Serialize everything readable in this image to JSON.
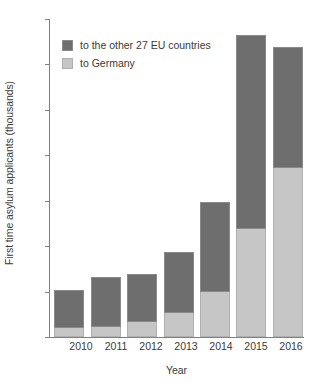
{
  "chart_data": {
    "type": "bar",
    "stacked": true,
    "title": "",
    "xlabel": "Year",
    "ylabel": "First time asylum applicants (thousands)",
    "categories": [
      "2010",
      "2011",
      "2012",
      "2013",
      "2014",
      "2015",
      "2016"
    ],
    "series": [
      {
        "name": "to Germany",
        "color": "#c6c6c6",
        "values": [
          41,
          45,
          64,
          105,
          200,
          476,
          745
        ]
      },
      {
        "name": "to the other 27 EU countries",
        "color": "#6e6e6e",
        "values": [
          165,
          220,
          215,
          270,
          395,
          855,
          530
        ]
      }
    ],
    "totals": [
      206,
      265,
      279,
      375,
      595,
      1331,
      1275
    ],
    "ylim": [
      0,
      1400
    ],
    "yticks": [
      0,
      200,
      400,
      600,
      800,
      1000,
      1200,
      1400
    ],
    "ytick_labels": [
      "0",
      "200",
      "400",
      "600",
      "800",
      "1000",
      "1200",
      "1400"
    ],
    "grid": false,
    "legend_position": "upper left",
    "legend": [
      "to the other 27 EU countries",
      "to Germany"
    ]
  },
  "colors": {
    "eu_other": "#6e6e6e",
    "germany": "#c6c6c6",
    "axis": "#808080",
    "text": "#3a3a3a",
    "background": "#ffffff"
  }
}
